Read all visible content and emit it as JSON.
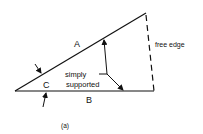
{
  "diagram": {
    "caption": "(a)",
    "edges": {
      "a": "A",
      "b": "B"
    },
    "corner": "C",
    "annotation_line1": "simply",
    "annotation_line2": "supported",
    "free_edge_label": "free edge"
  },
  "colors": {
    "stroke": "#111111",
    "background": "#ffffff"
  }
}
